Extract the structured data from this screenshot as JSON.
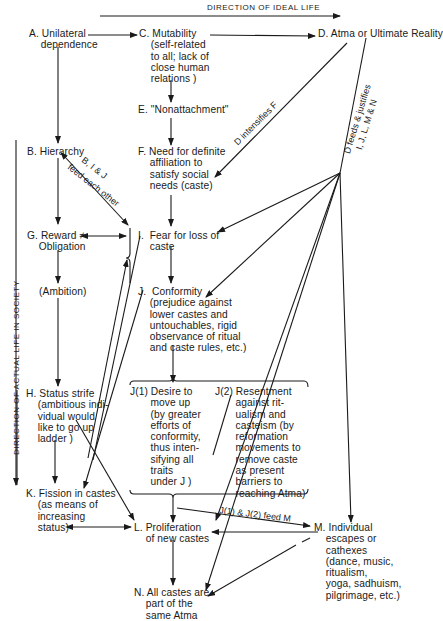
{
  "header": {
    "ideal_direction": "DIRECTION OF IDEAL LIFE",
    "actual_direction": "DIRECTION OF ACTUAL LIFE IN SOCIETY"
  },
  "nodes": {
    "A": "A. Unilateral\n    dependence",
    "B": "B. Hierarchy",
    "C": "C. Mutability\n    (self-related\n    to all; lack of\n    close human\n    relations )",
    "D": "D. Atma or Ultimate Reality",
    "E": "E. \"Nonattachment\"",
    "F": "F. Need for definite\n    affiliation to\n    satisfy social\n    needs (caste)",
    "G": "G. Reward ≠\n    Obligation",
    "ambition": "(Ambition)",
    "I": "I.  Fear for loss of\n    caste",
    "J": "J.  Conformity\n    (prejudice against\n    lower castes and\n    untouchables, rigid\n    observance of ritual\n    and caste rules, etc.)",
    "H": "H. Status strife\n    (ambitious indi-\n    vidual would\n    like to go up\n    ladder )",
    "J1": "J(1) Desire to\n       move up\n       (by greater\n       efforts of\n       conformity,\n       thus inten-\n       sifying all\n       traits\n       under J )",
    "J2": "J(2) Resentment\n       against rit-\n       ualism and\n       casteism (by\n       reformation\n       movements to\n       remove caste\n       as present\n       barriers to\n       reaching Atma)",
    "K": "K. Fission in castes\n    (as means of\n    increasing\n    status)",
    "L": "L. Proliferation\n    of new castes",
    "M": "M. Individual\n    escapes or\n    cathexes\n    (dance, music,\n    ritualism,\n    yoga, sadhuism,\n    pilgrimage, etc.)",
    "N": "N. All castes are\n    part of the\n    same Atma"
  },
  "edge_labels": {
    "d_intensifies_f": "D intensifies F",
    "d_feeds_line1": "D feeds & justifies",
    "d_feeds_line2": "I, J, L, M & N",
    "bij_line1": "B, I & J",
    "bij_line2": "feed each other",
    "j1j2_feed_m": "J(1) & J(2) feed M"
  }
}
